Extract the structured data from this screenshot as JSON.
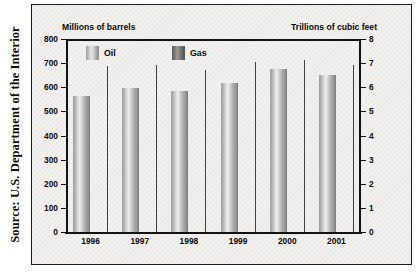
{
  "source_note": "Source: U.S. Department of the Interior",
  "legend": {
    "position": "inside-top",
    "items": [
      {
        "label": "Oil",
        "color": "#c8c8c6",
        "icon": "bar-swatch-icon"
      },
      {
        "label": "Gas",
        "color": "#6e6e6c",
        "icon": "bar-swatch-icon"
      }
    ]
  },
  "axes": {
    "left_title": "Millions of barrels",
    "right_title": "Trillions of cubic feet",
    "left_ticks": [
      "800",
      "700",
      "600",
      "500",
      "400",
      "300",
      "200",
      "100",
      "0"
    ],
    "right_ticks": [
      "8",
      "7",
      "6",
      "5",
      "4",
      "3",
      "2",
      "1",
      "0"
    ]
  },
  "chart_data": {
    "type": "bar",
    "title": "",
    "subtitle": "",
    "xlabel": "",
    "ylabel": "Millions of barrels",
    "y2label": "Trillions of cubic feet",
    "categories": [
      "1996",
      "1997",
      "1998",
      "1999",
      "2000",
      "2001"
    ],
    "series": [
      {
        "name": "Oil",
        "axis": "left",
        "unit": "Millions of barrels",
        "color": "#c8c8c6",
        "values": [
          563,
          597,
          586,
          616,
          675,
          650
        ]
      },
      {
        "name": "Gas",
        "axis": "right",
        "unit": "Trillions of cubic feet",
        "color": "#6e6e6c",
        "values": [
          6.9,
          6.92,
          6.7,
          7.03,
          7.12,
          6.94
        ]
      }
    ],
    "ylim": [
      0,
      800
    ],
    "y2lim": [
      0,
      8
    ],
    "ytick_step": 100,
    "y2tick_step": 1,
    "grid": false,
    "legend_position": "inside-top"
  }
}
